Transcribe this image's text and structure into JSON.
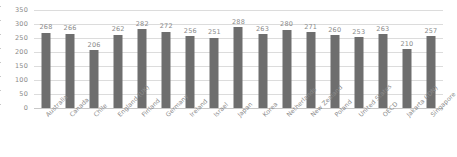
{
  "chart_data": {
    "type": "bar",
    "title": "",
    "subtitle": "",
    "xlabel": "",
    "ylabel": "",
    "ylim": [
      0,
      350
    ],
    "ytick_step": 50,
    "yticks": [
      "0",
      "50",
      "100",
      "150",
      "200",
      "250",
      "300",
      "350"
    ],
    "grid": true,
    "legend": "none",
    "bar_color": "#6e6e6e",
    "gridline_color": "#dcdcdc",
    "label_color": "#8a8a8a",
    "categories": [
      "Australia",
      "Canada",
      "Chile",
      "England (UK)",
      "Finland",
      "Germany",
      "Ireland",
      "Israel",
      "Japan",
      "Korea",
      "Netherlands",
      "New Zealand",
      "Poland",
      "United States",
      "OECD",
      "Jakarta (IDN)",
      "Singapore"
    ],
    "values": [
      268,
      266,
      206,
      262,
      282,
      272,
      256,
      251,
      288,
      263,
      280,
      271,
      260,
      253,
      263,
      210,
      257
    ],
    "data_labels": [
      "268",
      "266",
      "206",
      "262",
      "282",
      "272",
      "256",
      "251",
      "288",
      "263",
      "280",
      "271",
      "260",
      "253",
      "263",
      "210",
      "257"
    ]
  }
}
